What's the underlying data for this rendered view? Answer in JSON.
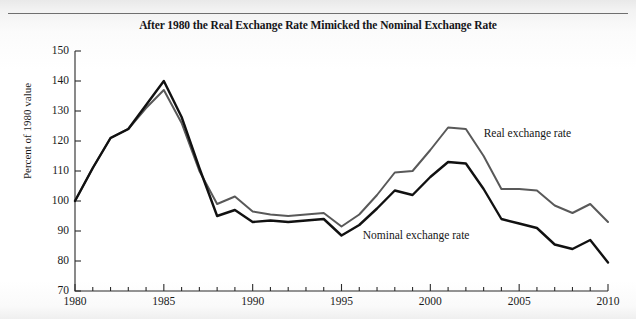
{
  "figure": {
    "title": "After 1980 the Real Exchange Rate Mimicked the Nominal Exchange Rate",
    "page_background": "#ffffff",
    "rule_color": "#6f6f6f"
  },
  "axes": {
    "y_title": "Percent of 1980 value",
    "y_ticks": [
      "150",
      "140",
      "130",
      "120",
      "110",
      "100",
      "90",
      "80",
      "70"
    ],
    "x_ticks": [
      "1980",
      "1985",
      "1990",
      "1995",
      "2000",
      "2005",
      "2010"
    ]
  },
  "labels": {
    "real": "Real exchange rate",
    "nominal": "Nominal exchange rate"
  },
  "chart_data": {
    "type": "line",
    "title": "After 1980 the Real Exchange Rate Mimicked the Nominal Exchange Rate",
    "xlabel": "",
    "ylabel": "Percent of 1980 value",
    "xlim": [
      1980,
      2010
    ],
    "ylim": [
      70,
      150
    ],
    "ytick_step": 10,
    "xtick_major_step": 5,
    "xtick_minor_step": 1,
    "grid": false,
    "legend": "inline-annotations",
    "x": [
      1980,
      1981,
      1982,
      1983,
      1984,
      1985,
      1986,
      1987,
      1988,
      1989,
      1990,
      1991,
      1992,
      1993,
      1994,
      1995,
      1996,
      1997,
      1998,
      1999,
      2000,
      2001,
      2002,
      2003,
      2004,
      2005,
      2006,
      2007,
      2008,
      2009,
      2010
    ],
    "series": [
      {
        "name": "Real exchange rate",
        "color": "#595959",
        "values": [
          100,
          111,
          121,
          124,
          131,
          137,
          126,
          110,
          99,
          101.5,
          96.5,
          95.5,
          95,
          95.5,
          96,
          91.5,
          95.5,
          102,
          109.5,
          110,
          117,
          124.5,
          124,
          115,
          104,
          104,
          103.5,
          98.5,
          96,
          99,
          93
        ]
      },
      {
        "name": "Nominal exchange rate",
        "color": "#111111",
        "values": [
          100,
          111,
          121,
          124,
          132,
          140,
          128,
          111,
          95,
          97,
          93,
          93.5,
          93,
          93.5,
          94,
          88.5,
          92,
          97.5,
          103.5,
          102,
          108,
          113,
          112.5,
          104,
          94,
          92.5,
          91,
          85.5,
          84,
          87,
          79.5
        ]
      }
    ]
  },
  "annotations": {
    "real_label_pos": {
      "x": 2003,
      "y": 122
    },
    "nominal_label_pos": {
      "x": 1996.2,
      "y": 88
    }
  }
}
